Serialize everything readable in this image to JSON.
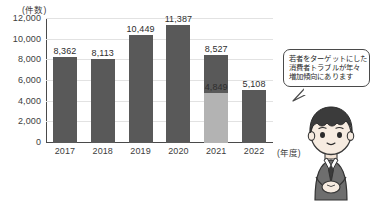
{
  "chart_data": {
    "type": "bar",
    "title": "",
    "xlabel": "(年度)",
    "ylabel": "(件数)",
    "categories": [
      "2017",
      "2018",
      "2019",
      "2020",
      "2021",
      "2022"
    ],
    "values": [
      8362,
      8113,
      10449,
      11387,
      8527,
      5108
    ],
    "value_labels": [
      "8,362",
      "8,113",
      "10,449",
      "11,387",
      "8,527",
      "5,108"
    ],
    "series": [
      {
        "name": "件数",
        "values": [
          8362,
          8113,
          10449,
          11387,
          8527,
          5108
        ]
      },
      {
        "name": "内訳",
        "values": [
          null,
          null,
          null,
          null,
          4849,
          null
        ],
        "value_labels": [
          null,
          null,
          null,
          null,
          "4,849",
          null
        ]
      }
    ],
    "stacked_segment": {
      "category": "2021",
      "lower_value": 4849,
      "lower_label": "4,849",
      "upper_value": 8527,
      "upper_label": "8,527"
    },
    "ylim": [
      0,
      12000
    ],
    "ytick_values": [
      0,
      2000,
      4000,
      6000,
      8000,
      10000,
      12000
    ],
    "ytick_labels": [
      "0",
      "2,000",
      "4,000",
      "6,000",
      "8,000",
      "10,000",
      "12,000"
    ],
    "grid": true,
    "legend": "none",
    "colors": {
      "bar_dark": "#595959",
      "bar_light": "#b3b3b3",
      "gridline": "#e2e2e2",
      "axis": "#4a4a4a",
      "text": "#2e2e2e"
    }
  },
  "axis": {
    "y_unit": "(件数)",
    "x_unit": "(年度)"
  },
  "callout": {
    "lines": [
      "若者をターゲットにした",
      "消費者トラブルが年々",
      "増加傾向にあります"
    ]
  },
  "character": {
    "alt": "illustrated-young-person"
  },
  "footer": {
    "note": ""
  }
}
